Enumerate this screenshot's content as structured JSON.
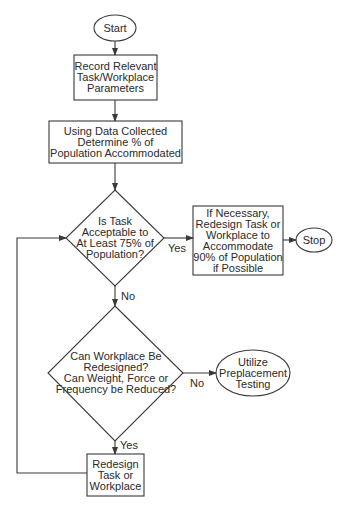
{
  "flowchart": {
    "nodes": {
      "start": {
        "type": "terminal",
        "text": "Start"
      },
      "record": {
        "type": "process",
        "text": "Record Relevant\nTask/Workplace\nParameters"
      },
      "determine": {
        "type": "process",
        "text": "Using Data Collected\nDetermine % of\nPopulation Accommodated"
      },
      "decision1": {
        "type": "decision",
        "text": "Is Task\nAcceptable to\nAt Least 75% of\nPopulation?"
      },
      "redesign90": {
        "type": "process",
        "text": "If Necessary,\nRedesign Task or\nWorkplace to\nAccommodate\n90% of Population\nif Possible"
      },
      "stop": {
        "type": "terminal",
        "text": "Stop"
      },
      "decision2": {
        "type": "decision",
        "text": "Can Workplace Be\nRedesigned?\nCan Weight, Force or\nFrequency be Reduced?"
      },
      "preplacement": {
        "type": "terminal",
        "text": "Utilize\nPreplacement\nTesting"
      },
      "redesign": {
        "type": "process",
        "text": "Redesign\nTask or\nWorkplace"
      }
    },
    "edges": {
      "d1_yes": "Yes",
      "d1_no": "No",
      "d2_no": "No",
      "d2_yes": "Yes"
    },
    "colors": {
      "stroke": "#3a3a3a",
      "fill": "#ffffff",
      "text": "#2a2a2a"
    }
  }
}
